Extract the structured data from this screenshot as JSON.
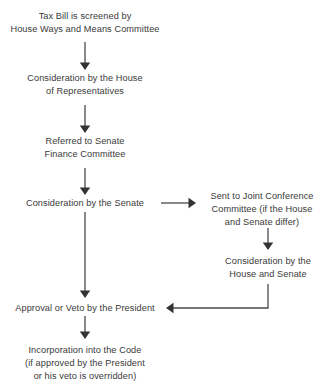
{
  "diagram": {
    "type": "flowchart",
    "background_color": "#ffffff",
    "text_color": "#3a3a3a",
    "connector_color": "#4a4a4a",
    "nodes": [
      {
        "id": "screening",
        "name": "tax-bill-screening",
        "lines": [
          "Tax Bill is screened by",
          "House Ways and Means Committee"
        ],
        "center_x": 85,
        "top": 10
      },
      {
        "id": "house-consideration",
        "name": "house-consideration",
        "lines": [
          "Consideration by the House",
          "of Representatives"
        ],
        "center_x": 85,
        "top": 72
      },
      {
        "id": "senate-referral",
        "name": "senate-finance-referral",
        "lines": [
          "Referred to Senate",
          "Finance Committee"
        ],
        "center_x": 85,
        "top": 135
      },
      {
        "id": "senate-consideration",
        "name": "senate-consideration",
        "lines": [
          "Consideration by the Senate"
        ],
        "center_x": 85,
        "top": 197
      },
      {
        "id": "joint-conference",
        "name": "joint-conference-committee",
        "lines": [
          "Sent to Joint Conference",
          "Committee (if the House",
          "and Senate differ)"
        ],
        "center_x": 262,
        "top": 190
      },
      {
        "id": "house-senate-consideration",
        "name": "house-and-senate-consideration",
        "lines": [
          "Consideration by the",
          "House and Senate"
        ],
        "center_x": 268,
        "top": 255
      },
      {
        "id": "president",
        "name": "presidential-approval-or-veto",
        "lines": [
          "Approval or Veto by the President"
        ],
        "center_x": 85,
        "top": 302
      },
      {
        "id": "incorporation",
        "name": "incorporation-into-code",
        "lines": [
          "Incorporation into the Code",
          "(if approved by the President",
          "or his veto is overridden)"
        ],
        "center_x": 85,
        "top": 344
      }
    ],
    "connectors": [
      {
        "id": "c1",
        "name": "arrow-screening-to-house",
        "from": "screening",
        "to": "house-consideration",
        "direction": "down",
        "path": "M85,42 L85,69",
        "arrow_at": [
          85,
          70
        ],
        "arrow_dir": "down"
      },
      {
        "id": "c2",
        "name": "arrow-house-to-senate-referral",
        "from": "house-consideration",
        "to": "senate-referral",
        "direction": "down",
        "path": "M85,105 L85,132",
        "arrow_at": [
          85,
          133
        ],
        "arrow_dir": "down"
      },
      {
        "id": "c3",
        "name": "arrow-referral-to-senate-consideration",
        "from": "senate-referral",
        "to": "senate-consideration",
        "direction": "down",
        "path": "M85,168 L85,194",
        "arrow_at": [
          85,
          195
        ],
        "arrow_dir": "down"
      },
      {
        "id": "c4",
        "name": "arrow-senate-to-joint-conference",
        "from": "senate-consideration",
        "to": "joint-conference",
        "direction": "right",
        "path": "M161,203 L193,203",
        "arrow_at": [
          196,
          203
        ],
        "arrow_dir": "right"
      },
      {
        "id": "c5",
        "name": "arrow-joint-conference-to-house-senate",
        "from": "joint-conference",
        "to": "house-senate-consideration",
        "direction": "down",
        "path": "M268,228 L268,249",
        "arrow_at": [
          268,
          250
        ],
        "arrow_dir": "down"
      },
      {
        "id": "c6",
        "name": "arrow-senate-to-president",
        "from": "senate-consideration",
        "to": "president",
        "direction": "down",
        "path": "M85,212 L85,297",
        "arrow_at": [
          85,
          298
        ],
        "arrow_dir": "down"
      },
      {
        "id": "c7",
        "name": "arrow-house-senate-to-president",
        "from": "house-senate-consideration",
        "to": "president",
        "direction": "left-elbow",
        "path": "M268,284 L268,308 L170,308",
        "arrow_at": [
          166,
          308
        ],
        "arrow_dir": "left"
      },
      {
        "id": "c8",
        "name": "arrow-president-to-incorporation",
        "from": "president",
        "to": "incorporation",
        "direction": "down",
        "path": "M85,316 L85,338",
        "arrow_at": [
          85,
          339
        ],
        "arrow_dir": "down"
      }
    ]
  }
}
